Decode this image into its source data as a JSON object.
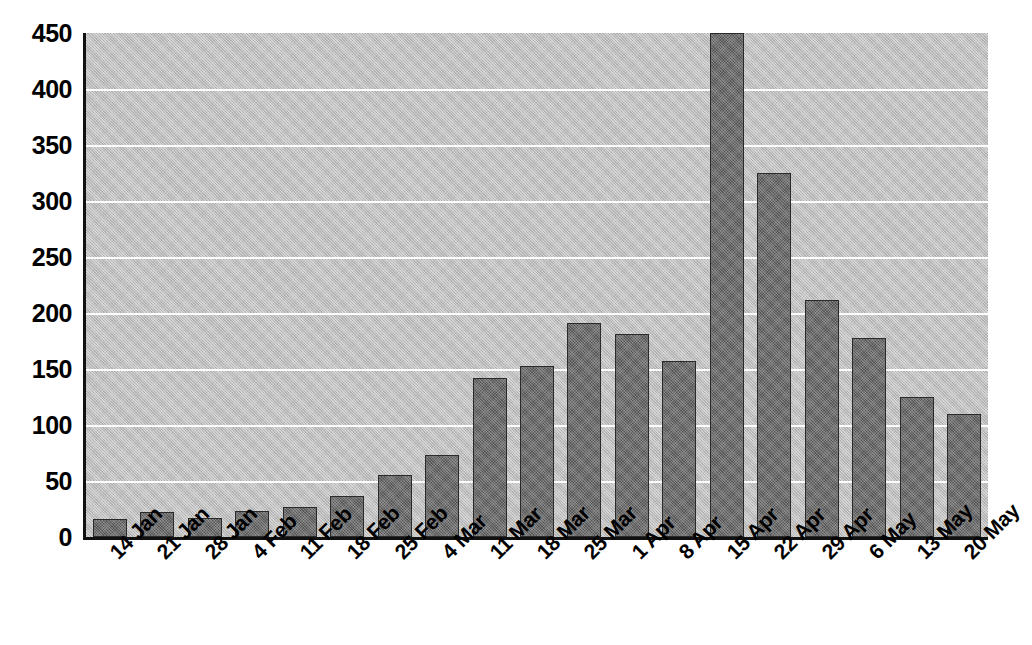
{
  "chart_data": {
    "type": "bar",
    "title": "",
    "subtitle": "",
    "xlabel": "",
    "ylabel": "",
    "ylim": [
      0,
      450
    ],
    "ytick_step": 50,
    "yticks": [
      450,
      400,
      350,
      300,
      250,
      200,
      150,
      100,
      50,
      0
    ],
    "ytick_labels": [
      "450",
      "400",
      "350",
      "300",
      "250",
      "200",
      "150",
      "100",
      "50",
      "0"
    ],
    "grid": true,
    "grid_axis": "y",
    "legend": false,
    "legend_position": "none",
    "categories": [
      "14 Jan",
      "21 Jan",
      "28 Jan",
      "4 Feb",
      "11 Feb",
      "18 Feb",
      "25 Feb",
      "4 Mar",
      "11 Mar",
      "18 Mar",
      "25 Mar",
      "1 Apr",
      "8 Apr",
      "15 Apr",
      "22 Apr",
      "29 Apr",
      "6 May",
      "13 May",
      "20 May"
    ],
    "values": [
      16,
      22,
      17,
      23,
      27,
      37,
      55,
      73,
      142,
      153,
      191,
      181,
      157,
      450,
      325,
      212,
      178,
      125,
      110
    ],
    "colors": {
      "bar_fill": "#6e6e6e",
      "bar_edge": "#2a2a2a",
      "plot_background": "#bdbdbd",
      "grid_color": "#fdfdfd",
      "axis_color": "#111111",
      "text_color": "#000000",
      "figure_background": "#ffffff"
    }
  }
}
